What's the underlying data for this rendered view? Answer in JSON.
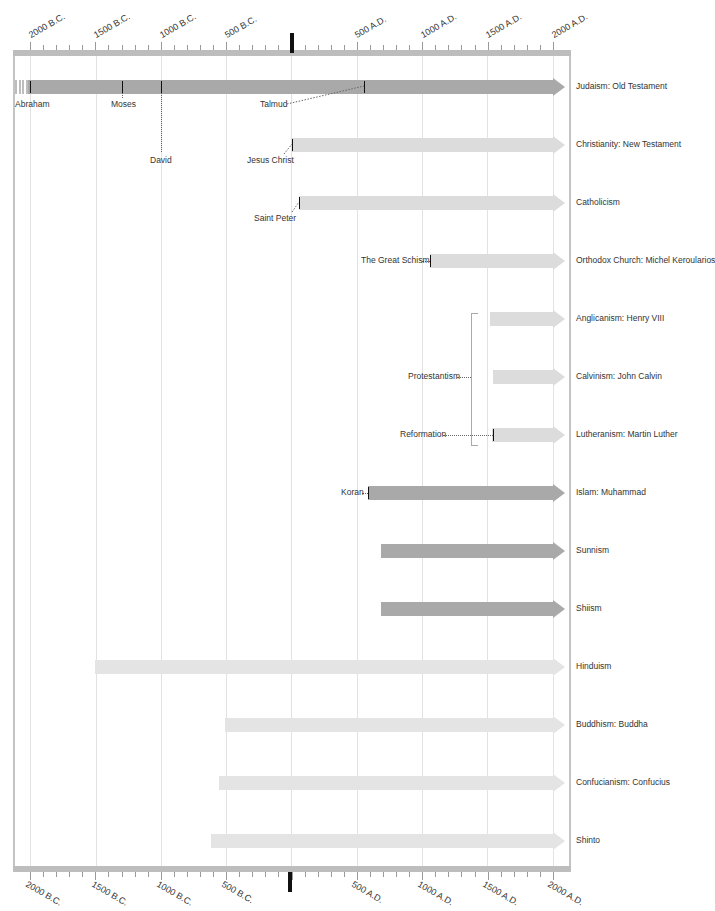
{
  "colors": {
    "dark_bar": "#a9a9a9",
    "light_bar": "#dcdcdc",
    "axis": "#bdbdbd",
    "zero_marker": "#111111",
    "gridline": "#e2e2e2"
  },
  "axis": {
    "top_labels": [
      "2000 B.C.",
      "1500 B.C.",
      "1000 B.C.",
      "500 B.C.",
      "500 A.D.",
      "1000 A.D.",
      "1500 A.D.",
      "2000 A.D."
    ],
    "bottom_labels": [
      "2000 B.C.",
      "1500 B.C.",
      "1000 B.C.",
      "500 B.C.",
      "500 A.D.",
      "1000 A.D.",
      "1500 A.D.",
      "2000 A.D."
    ]
  },
  "rows": [
    {
      "label": "Judaism: Old Testament"
    },
    {
      "label": "Christianity: New Testament"
    },
    {
      "label": "Catholicism"
    },
    {
      "label": "Orthodox Church: Michel Keroularios"
    },
    {
      "label": "Anglicanism: Henry VIII"
    },
    {
      "label": "Calvinism: John Calvin"
    },
    {
      "label": "Lutheranism: Martin Luther"
    },
    {
      "label": "Islam: Muhammad"
    },
    {
      "label": "Sunnism"
    },
    {
      "label": "Shiism"
    },
    {
      "label": "Hinduism"
    },
    {
      "label": "Buddhism: Buddha"
    },
    {
      "label": "Confucianism: Confucius"
    },
    {
      "label": "Shinto"
    }
  ],
  "events": {
    "abraham": "Abraham",
    "moses": "Moses",
    "david": "David",
    "talmud": "Talmud",
    "jesus": "Jesus Christ",
    "peter": "Saint Peter",
    "schism": "The Great Schism",
    "protestantism": "Protestantism",
    "reformation": "Reformation",
    "koran": "Koran"
  },
  "chart_data": {
    "type": "timeline",
    "title": "",
    "x_axis": {
      "min": -2000,
      "max": 2000,
      "unit": "year",
      "major_step": 500,
      "minor_step": 100,
      "tick_labels": [
        "2000 B.C.",
        "1500 B.C.",
        "1000 B.C.",
        "500 B.C.",
        "0",
        "500 A.D.",
        "1000 A.D.",
        "1500 A.D.",
        "2000 A.D."
      ]
    },
    "series": [
      {
        "name": "Judaism: Old Testament",
        "start": -2000,
        "end": 2000,
        "shade": "dark",
        "fades_in_before_start": true
      },
      {
        "name": "Christianity: New Testament",
        "start": 0,
        "end": 2000,
        "shade": "light"
      },
      {
        "name": "Catholicism",
        "start": 60,
        "end": 2000,
        "shade": "light"
      },
      {
        "name": "Orthodox Church: Michel Keroularios",
        "start": 1054,
        "end": 2000,
        "shade": "light"
      },
      {
        "name": "Anglicanism: Henry VIII",
        "start": 1534,
        "end": 2000,
        "shade": "light"
      },
      {
        "name": "Calvinism: John Calvin",
        "start": 1541,
        "end": 2000,
        "shade": "light"
      },
      {
        "name": "Lutheranism: Martin Luther",
        "start": 1517,
        "end": 2000,
        "shade": "light"
      },
      {
        "name": "Islam: Muhammad",
        "start": 610,
        "end": 2000,
        "shade": "dark"
      },
      {
        "name": "Sunnism",
        "start": 680,
        "end": 2000,
        "shade": "dark"
      },
      {
        "name": "Shiism",
        "start": 680,
        "end": 2000,
        "shade": "dark"
      },
      {
        "name": "Hinduism",
        "start": -1500,
        "end": 2000,
        "shade": "light"
      },
      {
        "name": "Buddhism: Buddha",
        "start": -500,
        "end": 2000,
        "shade": "light"
      },
      {
        "name": "Confucianism: Confucius",
        "start": -550,
        "end": 2000,
        "shade": "light"
      },
      {
        "name": "Shinto",
        "start": -600,
        "end": 2000,
        "shade": "light"
      }
    ],
    "annotations": [
      {
        "text": "Abraham",
        "year": -1990,
        "row": "Judaism: Old Testament"
      },
      {
        "text": "Moses",
        "year": -1300,
        "row": "Judaism: Old Testament"
      },
      {
        "text": "David",
        "year": -1000,
        "row": "Judaism: Old Testament"
      },
      {
        "text": "Talmud",
        "year": 560,
        "row": "Judaism: Old Testament"
      },
      {
        "text": "Jesus Christ",
        "year": 0,
        "row": "Christianity: New Testament"
      },
      {
        "text": "Saint Peter",
        "year": 60,
        "row": "Catholicism"
      },
      {
        "text": "The Great Schism",
        "year": 1054,
        "row": "Orthodox Church: Michel Keroularios"
      },
      {
        "text": "Reformation",
        "year": 1517,
        "row": "Lutheranism: Martin Luther"
      },
      {
        "text": "Protestantism",
        "group": [
          "Anglicanism: Henry VIII",
          "Calvinism: John Calvin",
          "Lutheranism: Martin Luther"
        ]
      },
      {
        "text": "Koran",
        "year": 610,
        "row": "Islam: Muhammad"
      }
    ],
    "grid": true,
    "legend": "none"
  }
}
